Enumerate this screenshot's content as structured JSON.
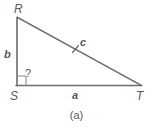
{
  "figure": {
    "caption": "(a)",
    "stroke_color": "#6b6b6b",
    "text_color": "#58585a",
    "background": "#ffffff",
    "vertices": [
      {
        "name": "R",
        "label": "R",
        "x": 17,
        "y": 17
      },
      {
        "name": "S",
        "label": "S",
        "x": 17,
        "y": 85
      },
      {
        "name": "T",
        "label": "T",
        "x": 141,
        "y": 85
      }
    ],
    "sides": [
      {
        "name": "leg-vertical",
        "label": "b",
        "from": "S",
        "to": "R"
      },
      {
        "name": "leg-horizontal",
        "label": "a",
        "from": "S",
        "to": "T"
      },
      {
        "name": "hypotenuse",
        "label": "c",
        "from": "R",
        "to": "T"
      }
    ],
    "angle_marker": {
      "name": "angle-at-s",
      "label": "?",
      "vertex": "S",
      "type": "right-angle-square"
    },
    "tick_mark": {
      "name": "hypotenuse-tick",
      "on": "hypotenuse",
      "count": 1
    }
  }
}
